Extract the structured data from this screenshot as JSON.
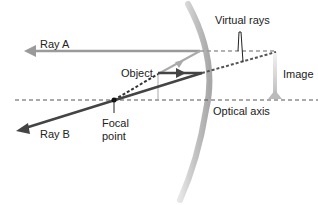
{
  "diagram": {
    "labels": {
      "ray_a": "Ray A",
      "ray_b": "Ray B",
      "object": "Object",
      "image": "Image",
      "virtual_rays": "Virtual rays",
      "focal_point_line1": "Focal",
      "focal_point_line2": "point",
      "optical_axis": "Optical axis"
    },
    "colors": {
      "ray_light": "#9a9a9a",
      "ray_dark": "#444444",
      "mirror": "#c8c8c8",
      "object": "#b0b0b0",
      "axis": "#555555",
      "image": "#d0d0d0"
    }
  }
}
